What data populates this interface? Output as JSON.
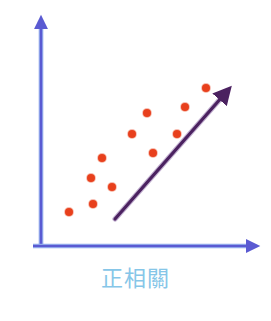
{
  "figure": {
    "caption": "正相關",
    "caption_color": "#86c6e8",
    "background_color": "#ffffff",
    "axis_color": "#5a5ad2",
    "axis_edge_color": "#8fa6ea",
    "trendline_color": "#4b2060",
    "point_color": "#e8401c",
    "width": 271,
    "height": 321
  },
  "chart_data": {
    "type": "scatter",
    "title": "正相關",
    "xlabel": "",
    "ylabel": "",
    "grid": false,
    "legend": null,
    "axes": {
      "origin": [
        41,
        246
      ],
      "x_axis_end": [
        256,
        246
      ],
      "y_axis_end": [
        41,
        19
      ],
      "xlim": [
        0,
        10
      ],
      "ylim": [
        0,
        10
      ],
      "arrowheads": [
        "x-positive",
        "y-positive"
      ]
    },
    "points_px": [
      [
        69,
        212
      ],
      [
        93,
        204
      ],
      [
        91,
        178
      ],
      [
        112,
        187
      ],
      [
        102,
        158
      ],
      [
        132,
        134
      ],
      [
        147,
        113
      ],
      [
        153,
        153
      ],
      [
        177,
        134
      ],
      [
        185,
        107
      ],
      [
        206,
        88
      ]
    ],
    "x": [
      1.3,
      2.4,
      2.3,
      3.3,
      2.8,
      4.2,
      4.9,
      5.2,
      6.3,
      6.7,
      7.7
    ],
    "y": [
      1.5,
      1.9,
      3.0,
      2.6,
      3.9,
      4.9,
      5.9,
      4.1,
      4.9,
      6.1,
      7.0
    ],
    "series": [
      {
        "name": "data-points",
        "color": "#e8401c",
        "marker": "circle",
        "marker_size_px": 8,
        "count": 11
      }
    ],
    "trendline": {
      "name": "positive-trend-arrow",
      "color": "#4b2060",
      "start_px": [
        115,
        219
      ],
      "end_px": [
        229,
        89
      ],
      "arrow": "end",
      "slope_sign": "positive"
    },
    "annotation": "Scatter plot illustrating positive correlation: points rise from lower-left to upper-right with an upward trend arrow."
  }
}
